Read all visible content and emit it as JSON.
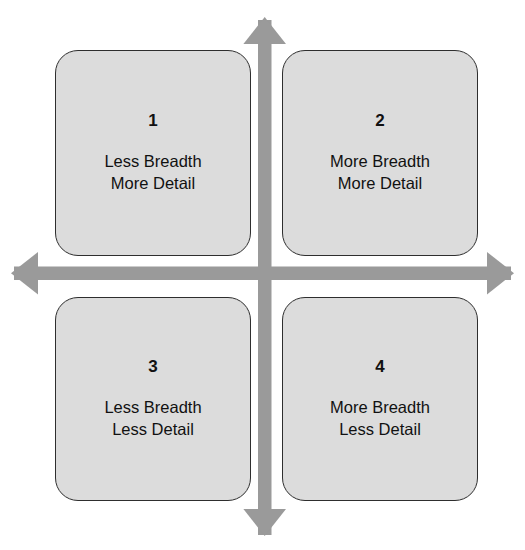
{
  "diagram": {
    "background_color": "#ffffff",
    "box_fill_color": "#dcdcdc",
    "box_border_color": "#2e2e2e",
    "arrow_color": "#9a9a9a",
    "text_color": "#111111"
  },
  "axes": {
    "vertical": {
      "name": "vertical-axis",
      "arrowheads": "both",
      "color": "#9a9a9a"
    },
    "horizontal": {
      "name": "horizontal-axis",
      "arrowheads": "both",
      "color": "#9a9a9a"
    }
  },
  "quadrants": [
    {
      "id": "quadrant-1",
      "number": "1",
      "line1": "Less Breadth",
      "line2": "More Detail",
      "position": "top-left"
    },
    {
      "id": "quadrant-2",
      "number": "2",
      "line1": "More Breadth",
      "line2": "More Detail",
      "position": "top-right"
    },
    {
      "id": "quadrant-3",
      "number": "3",
      "line1": "Less Breadth",
      "line2": "Less Detail",
      "position": "bottom-left"
    },
    {
      "id": "quadrant-4",
      "number": "4",
      "line1": "More Breadth",
      "line2": "Less Detail",
      "position": "bottom-right"
    }
  ]
}
